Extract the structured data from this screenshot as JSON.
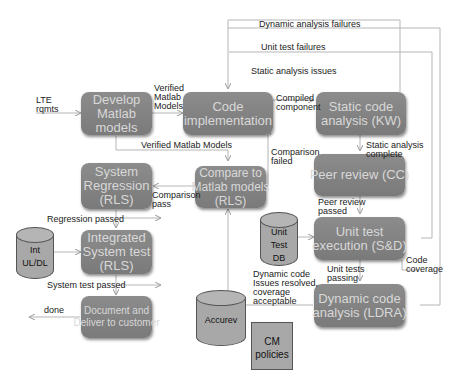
{
  "boxes": {
    "develop": "Develop\nMatlab\nmodels",
    "code_impl": "Code\nimplementation",
    "static": "Static code\nanalysis (KW)",
    "sysreg": "System\nRegression\n(RLS)",
    "compare": "Compare to\nMatlab models\n(RLS)",
    "peer": "Peer review (CC)",
    "integrated": "Integrated\nSystem test\n(RLS)",
    "unittest": "Unit test\nexecution (S&D)",
    "document": "Document and\nDeliver to customer",
    "dynamic": "Dynamic code\nanalysis (LDRA)"
  },
  "stores": {
    "int_uldl": "Int\nUL/DL",
    "unit_test_db": "Unit\nTest\nDB",
    "accurev": "Accurev",
    "cm_policies": "CM\npolicies"
  },
  "labels": {
    "lte": "LTE\nrqmts",
    "verified1": "Verified\nMatlab\nModels",
    "verified2": "Verified Matlab Models",
    "dyn_fail": "Dynamic analysis failures",
    "unit_fail": "Unit test failures",
    "static_issues": "Static analysis issues",
    "compiled": "Compiled\ncomponent",
    "static_complete": "Static analysis\ncomplete",
    "comp_failed": "Comparison\nfailed",
    "comp_pass": "Comparison\npass",
    "reg_passed": "Regression passed",
    "peer_passed": "Peer review\npassed",
    "code_cov": "Code\ncoverage",
    "ut_passing": "Unit tests\npassing",
    "dyn_resolved": "Dynamic code\nIssues resolved,\ncoverage\nacceptable",
    "sys_passed": "System test passed",
    "done": "done"
  },
  "colors": {
    "box": "#848484",
    "box_text": "#d8d8d8",
    "line": "#b0b0b0",
    "store": "#a8a8a8"
  }
}
